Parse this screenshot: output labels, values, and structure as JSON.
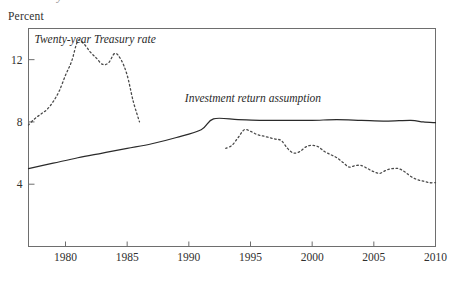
{
  "figure": {
    "clipped_title_fragment": "y",
    "y_axis_unit_label": "Percent"
  },
  "chart_data": {
    "type": "line",
    "title": "",
    "subtitle": "",
    "xlabel": "",
    "ylabel": "Percent",
    "xlim": [
      1977,
      2010
    ],
    "ylim": [
      0,
      14
    ],
    "xticks": [
      1980,
      1985,
      1990,
      1995,
      2000,
      2005,
      2010
    ],
    "xtick_labels": [
      "1980",
      "1985",
      "1990",
      "1995",
      "2000",
      "2005",
      "2010"
    ],
    "yticks": [
      4,
      8,
      12
    ],
    "ytick_labels": [
      "4",
      "8",
      "12"
    ],
    "grid": false,
    "legend_position": "inline-annotation",
    "frame": "box",
    "series": [
      {
        "name": "Twenty-year Treasury rate",
        "style": "dotted",
        "color": "#4a4a4a",
        "annotation": "Twenty-year Treasury rate",
        "annotation_x": 1982.4,
        "annotation_y": 13.1,
        "x": [
          1977,
          1977.5,
          1978,
          1978.5,
          1979,
          1979.5,
          1980,
          1980.5,
          1981,
          1981.5,
          1982,
          1982.5,
          1983,
          1983.5,
          1984,
          1984.5,
          1985,
          1985.5,
          1986,
          1993,
          1993.5,
          1994,
          1994.5,
          1995,
          1995.5,
          1996,
          1996.5,
          1997,
          1997.5,
          1998,
          1998.5,
          1999,
          1999.5,
          2000,
          2000.5,
          2001,
          2001.5,
          2002,
          2002.5,
          2003,
          2003.5,
          2004,
          2004.5,
          2005,
          2005.5,
          2006,
          2006.5,
          2007,
          2007.5,
          2008,
          2008.5,
          2009,
          2009.5,
          2010
        ],
        "y": [
          7.8,
          8.2,
          8.5,
          8.8,
          9.3,
          10.0,
          11.0,
          11.9,
          13.2,
          13.0,
          12.5,
          12.1,
          11.7,
          11.8,
          12.4,
          12.0,
          11.0,
          9.3,
          8.0,
          6.3,
          6.5,
          7.0,
          7.5,
          7.4,
          7.2,
          7.1,
          7.0,
          6.9,
          6.8,
          6.3,
          6.0,
          6.1,
          6.4,
          6.5,
          6.4,
          6.1,
          5.9,
          5.7,
          5.4,
          5.1,
          5.2,
          5.2,
          5.0,
          4.8,
          4.7,
          4.9,
          5.0,
          5.0,
          4.8,
          4.5,
          4.3,
          4.2,
          4.1,
          4.1
        ]
      },
      {
        "name": "Investment return assumption",
        "style": "solid",
        "color": "#2a2a2a",
        "annotation": "Investment return assumption",
        "annotation_x": 1995.2,
        "annotation_y": 9.3,
        "x": [
          1977,
          1979,
          1981,
          1983,
          1985,
          1987,
          1989,
          1991,
          1992,
          1994,
          1996,
          1998,
          2000,
          2002,
          2004,
          2006,
          2008,
          2009,
          2010
        ],
        "y": [
          5.0,
          5.35,
          5.7,
          6.0,
          6.3,
          6.6,
          7.0,
          7.5,
          8.2,
          8.15,
          8.1,
          8.1,
          8.1,
          8.15,
          8.1,
          8.05,
          8.1,
          8.0,
          7.95
        ]
      }
    ]
  }
}
